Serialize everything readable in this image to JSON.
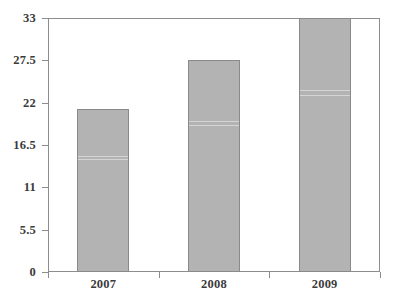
{
  "chart_data": {
    "type": "bar",
    "title": "",
    "subtitle": "",
    "xlabel": "",
    "ylabel": "",
    "categories": [
      "2007",
      "2008",
      "2009"
    ],
    "values": [
      21.2,
      27.5,
      33
    ],
    "series": [
      {
        "name": "",
        "values": [
          21.2,
          27.5,
          33
        ]
      }
    ],
    "ylim": [
      0,
      33
    ],
    "yticks": [
      0,
      5.5,
      11,
      16.5,
      22,
      27.5,
      33
    ],
    "ytick_labels": [
      "0",
      "5.5",
      "11",
      "16.5",
      "22",
      "27.5",
      "33"
    ],
    "xtick_labels": [
      "2007",
      "2008",
      "2009"
    ],
    "grid": false,
    "legend": null,
    "legend_position": "none",
    "annotations": [],
    "colors": {
      "bar_fill": "#b3b3b3",
      "bar_border": "#8a8a8a",
      "axis_line": "#8d8d8d",
      "tick_label": "#3b3b3b",
      "background": "#ffffff"
    }
  }
}
